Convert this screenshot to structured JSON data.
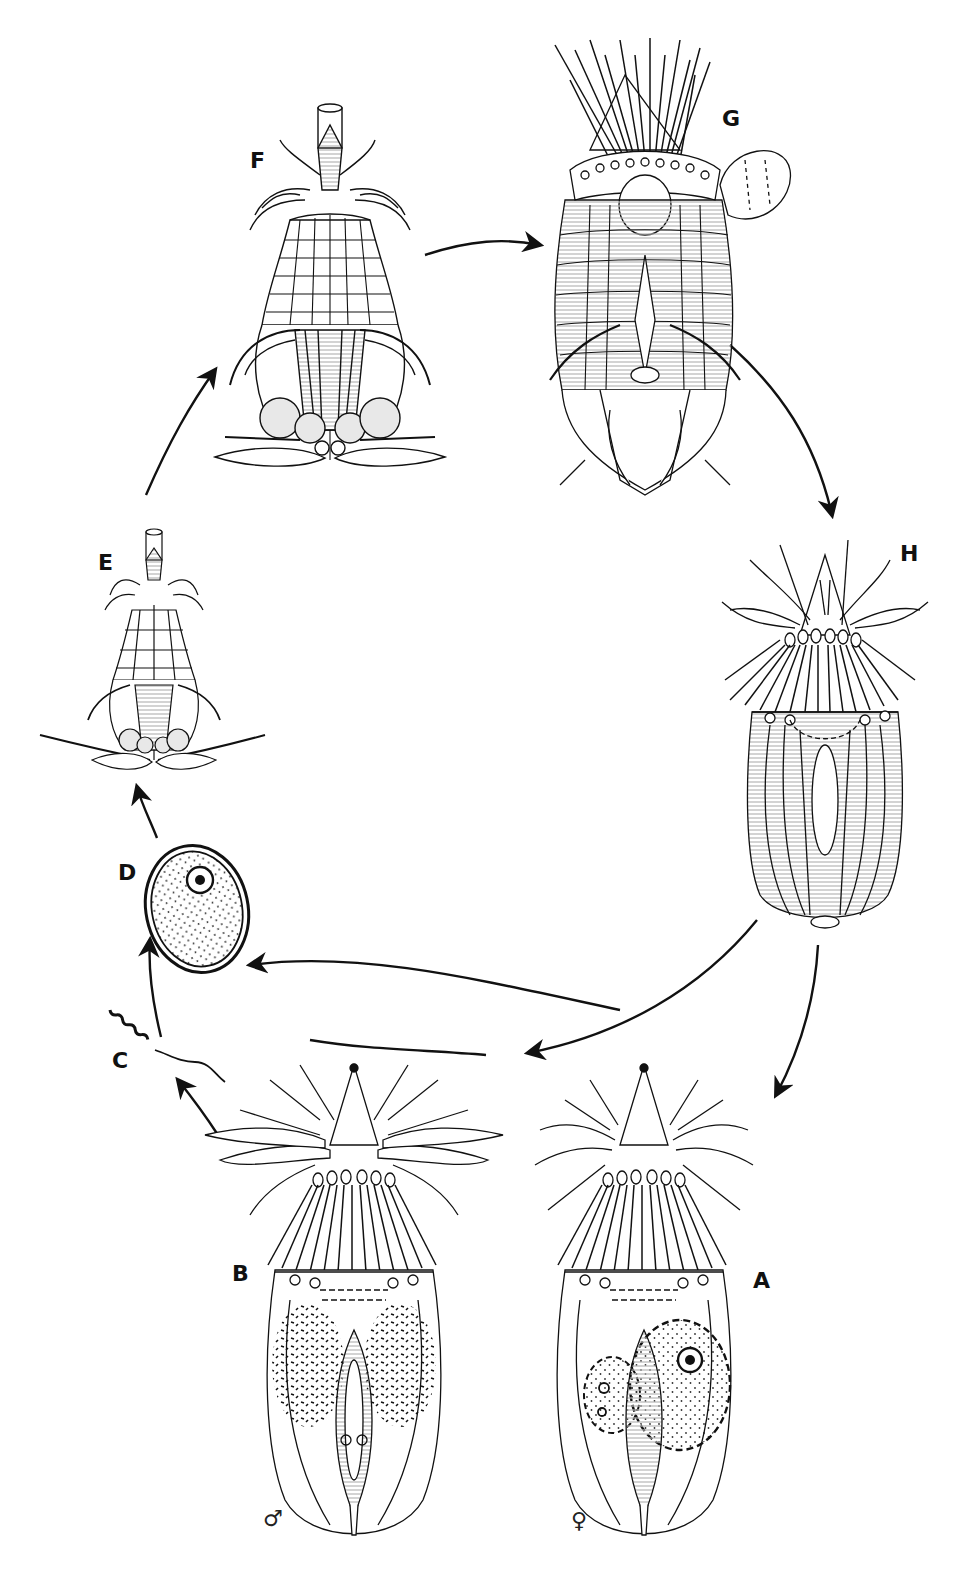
{
  "figure": {
    "type": "life-cycle diagram",
    "stroke_color": "#111111",
    "fill_color": "#ffffff",
    "hatch_color": "#bdbdbd"
  },
  "stages": [
    {
      "id": "A",
      "label": "A",
      "sex": "♀",
      "description": "adult female with ovary and large oocyte"
    },
    {
      "id": "B",
      "label": "B",
      "sex": "♂",
      "description": "adult male with paired testes"
    },
    {
      "id": "C",
      "label": "C",
      "description": "spermatozoon"
    },
    {
      "id": "D",
      "label": "D",
      "description": "fertilized egg with nucleus"
    },
    {
      "id": "E",
      "label": "E",
      "description": "early larva with toes"
    },
    {
      "id": "F",
      "label": "F",
      "description": "later larva with mouth cone and toes"
    },
    {
      "id": "G",
      "label": "G",
      "description": "last larval stage / postlarva with exuvium"
    },
    {
      "id": "H",
      "label": "H",
      "description": "juvenile / postlarva with lorica plates"
    }
  ],
  "sex_symbols": {
    "male": "♂",
    "female": "♀"
  },
  "arrows": [
    {
      "from": "E",
      "to": "F"
    },
    {
      "from": "F",
      "to": "G"
    },
    {
      "from": "G",
      "to": "H"
    },
    {
      "from": "H",
      "to": "A"
    },
    {
      "from": "H",
      "to": "B"
    },
    {
      "from": "B",
      "to": "C"
    },
    {
      "from": "C",
      "to": "D"
    },
    {
      "from": "D",
      "to": "E"
    }
  ]
}
